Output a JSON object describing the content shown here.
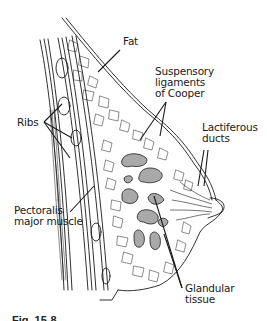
{
  "figure": {
    "type": "anatomical-diagram",
    "labels": {
      "fat": "Fat",
      "suspensory_1": "Suspensory",
      "suspensory_2": "ligaments",
      "suspensory_3": "of Cooper",
      "lactiferous_1": "Lactiferous",
      "lactiferous_2": "ducts",
      "ribs": "Ribs",
      "pectoralis_1": "Pectoralis",
      "pectoralis_2": "major muscle",
      "glandular_1": "Glandular",
      "glandular_2": "tissue"
    },
    "caption": "Fig. 15-8",
    "colors": {
      "line": "#1a1a1a",
      "gland_fill": "#a9a9a9",
      "background": "#ffffff"
    }
  }
}
